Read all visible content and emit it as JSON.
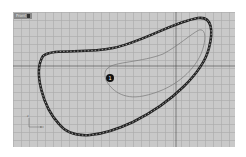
{
  "viewport": {
    "label": "Front",
    "background": "#c9c9c9",
    "grid_color": "#aaaaaa",
    "axis_line_color": "#444444"
  },
  "callout": {
    "number": "1"
  },
  "axis_icon": {
    "x_label": "x",
    "y_label": "z"
  }
}
